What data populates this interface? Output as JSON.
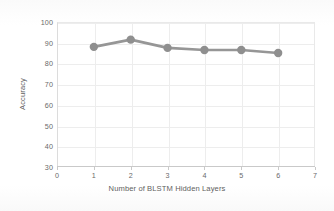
{
  "chart_data": {
    "type": "line",
    "title": "",
    "xlabel": "Number of BLSTM Hidden Layers",
    "ylabel": "Accuracy",
    "x": [
      1,
      2,
      3,
      4,
      5,
      6
    ],
    "values": [
      88,
      91.5,
      87.5,
      86.5,
      86.5,
      85
    ],
    "series": [
      {
        "name": "Accuracy",
        "values": [
          88,
          91.5,
          87.5,
          86.5,
          86.5,
          85
        ]
      }
    ],
    "xlim": [
      0,
      7
    ],
    "ylim": [
      30,
      100
    ],
    "xticks": [
      0,
      1,
      2,
      3,
      4,
      5,
      6,
      7
    ],
    "yticks": [
      30,
      40,
      50,
      60,
      70,
      80,
      90,
      100
    ],
    "xtick_labels": [
      "0",
      "1",
      "2",
      "3",
      "4",
      "5",
      "6",
      "7"
    ],
    "ytick_labels": [
      "30",
      "40",
      "50",
      "60",
      "70",
      "80",
      "90",
      "100"
    ],
    "grid": true,
    "grid_axis": "both",
    "legend": false,
    "legend_position": "none",
    "marker": "circle",
    "line_color": "#969696",
    "marker_color": "#8f8f8f",
    "grid_color": "#ededed",
    "axis_color": "#c9c9c9",
    "tick_label_color": "#6a6a6a",
    "axis_title_color": "#5e5e5e",
    "background_color": "#ffffff",
    "line_width": 2.6,
    "marker_size": 4.2
  }
}
